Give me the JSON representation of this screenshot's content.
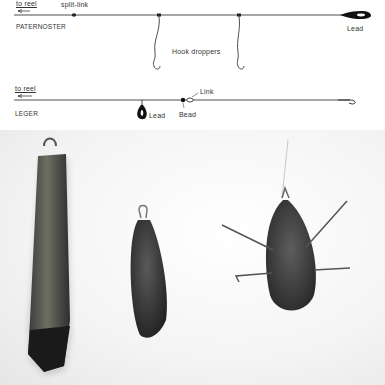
{
  "paternoster": {
    "to_reel": "to reel",
    "split_link": "split-link",
    "title": "PATERNOSTER",
    "droppers_label": "Hook droppers",
    "lead_label": "Lead"
  },
  "leger": {
    "to_reel": "to reel",
    "title": "LEGER",
    "lead_label": "Lead",
    "bead_label": "Bead",
    "link_label": "Link"
  },
  "photo": {
    "items": [
      "long-bar-lead",
      "pear-lead",
      "grip-lead-with-wires"
    ]
  }
}
